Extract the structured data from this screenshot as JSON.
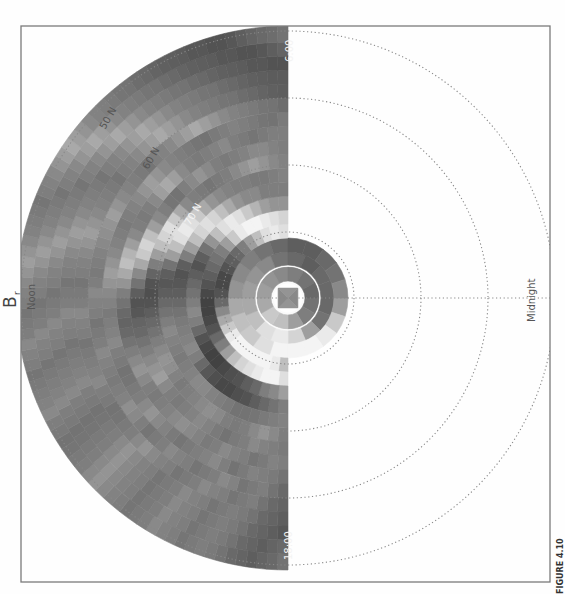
{
  "chart_data": {
    "type": "heatmap",
    "projection": "polar",
    "orientation": "rotated 90deg (noon at left, midnight at right)",
    "title": "B",
    "title_subscript": "r",
    "figure_label": "FIGURE 4.10",
    "local_time_labels": {
      "noon": "Noon",
      "midnight": "Midnight",
      "dawn": "6:00",
      "dusk": "18:00"
    },
    "latitude_labels": [
      "70 N",
      "60 N",
      "50 N"
    ],
    "latitude_rings_px": [
      66,
      133,
      200,
      267
    ],
    "colormap": "grayscale (dark = strong negative, white = strong positive)",
    "grid_on": true,
    "center_px": [
      288,
      298
    ],
    "rings": [
      {
        "r0": 0,
        "r1": 14,
        "sectors": 4,
        "values": [
          0.45,
          0.5,
          0.45,
          0.5
        ]
      },
      {
        "r0": 17,
        "r1": 31,
        "sectors": 12,
        "values": [
          0.35,
          0.4,
          0.55,
          0.7,
          0.75,
          0.6,
          0.55,
          0.5,
          0.45,
          0.4,
          0.35,
          0.3
        ]
      },
      {
        "r0": 33,
        "r1": 46,
        "sectors": 16,
        "values": [
          0.3,
          0.35,
          0.55,
          0.8,
          0.9,
          0.85,
          0.7,
          0.6,
          0.55,
          0.5,
          0.45,
          0.35,
          0.3,
          0.25,
          0.3,
          0.3
        ]
      },
      {
        "r0": 46,
        "r1": 60,
        "sectors": 20,
        "values": [
          0.55,
          0.75,
          0.9,
          0.95,
          0.95,
          0.95,
          0.85,
          0.75,
          0.7,
          0.6,
          0.5,
          0.45,
          0.4,
          0.35,
          0.3,
          0.25,
          0.25,
          0.3,
          0.35,
          0.45
        ]
      },
      {
        "r0": 60,
        "r1": 74,
        "sectors": 24,
        "values": [
          0.7,
          0.9,
          0.95,
          0.95,
          0.95,
          0.95,
          0.95,
          0.9,
          0.75,
          0.6,
          0.45,
          0.3,
          0.2,
          0.15,
          0.15,
          0.2,
          0.25,
          0.3,
          0.4,
          0.55,
          0.7,
          0.85,
          0.9,
          0.85
        ]
      },
      {
        "r0": 74,
        "r1": 88,
        "sectors": 28,
        "values": [
          0.85,
          0.95,
          0.95,
          0.9,
          0.85,
          0.8,
          0.7,
          0.55,
          0.4,
          0.3,
          0.2,
          0.15,
          0.12,
          0.12,
          0.15,
          0.2,
          0.25,
          0.3,
          0.35,
          0.4,
          0.55,
          0.75,
          0.9,
          0.95,
          0.95,
          0.9,
          0.85,
          0.8
        ]
      },
      {
        "r0": 88,
        "r1": 102,
        "sectors": 32,
        "values": [
          0.55,
          0.45,
          0.4,
          0.3,
          0.25,
          0.2,
          0.18,
          0.15,
          0.12,
          0.12,
          0.15,
          0.2,
          0.3,
          0.4,
          0.45,
          0.4,
          0.35,
          0.3,
          0.25,
          0.2,
          0.25,
          0.35,
          0.5,
          0.7,
          0.85,
          0.9,
          0.85,
          0.75,
          0.65,
          0.55,
          0.5,
          0.5
        ]
      },
      {
        "r0": 102,
        "r1": 116,
        "sectors": 36,
        "values": [
          0.4,
          0.35,
          0.3,
          0.25,
          0.2,
          0.18,
          0.15,
          0.15,
          0.18,
          0.22,
          0.3,
          0.4,
          0.45,
          0.42,
          0.4,
          0.38,
          0.35,
          0.3,
          0.25,
          0.22,
          0.2,
          0.25,
          0.4,
          0.55,
          0.7,
          0.8,
          0.85,
          0.8,
          0.7,
          0.6,
          0.5,
          0.45,
          0.45,
          0.4,
          0.4,
          0.4
        ]
      },
      {
        "r0": 116,
        "r1": 130,
        "sectors": 40,
        "values": [
          0.42,
          0.4,
          0.38,
          0.36,
          0.35,
          0.35,
          0.38,
          0.4,
          0.42,
          0.45,
          0.45,
          0.42,
          0.4,
          0.38,
          0.4,
          0.42,
          0.45,
          0.4,
          0.35,
          0.3,
          0.25,
          0.22,
          0.25,
          0.35,
          0.55,
          0.7,
          0.85,
          0.9,
          0.85,
          0.75,
          0.6,
          0.5,
          0.45,
          0.42,
          0.4,
          0.4,
          0.38,
          0.38,
          0.4,
          0.42
        ]
      },
      {
        "r0": 130,
        "r1": 144,
        "sectors": 44,
        "values": [
          0.4,
          0.45,
          0.5,
          0.45,
          0.4,
          0.38,
          0.4,
          0.45,
          0.48,
          0.45,
          0.42,
          0.4,
          0.38,
          0.42,
          0.48,
          0.5,
          0.45,
          0.4,
          0.35,
          0.3,
          0.25,
          0.2,
          0.18,
          0.2,
          0.28,
          0.4,
          0.55,
          0.7,
          0.8,
          0.85,
          0.75,
          0.6,
          0.45,
          0.4,
          0.38,
          0.36,
          0.38,
          0.4,
          0.45,
          0.5,
          0.55,
          0.5,
          0.45,
          0.42
        ]
      },
      {
        "r0": 144,
        "r1": 158,
        "sectors": 48,
        "values": [
          0.38,
          0.4,
          0.42,
          0.45,
          0.4,
          0.38,
          0.35,
          0.38,
          0.42,
          0.45,
          0.42,
          0.4,
          0.38,
          0.4,
          0.45,
          0.55,
          0.5,
          0.45,
          0.4,
          0.35,
          0.3,
          0.28,
          0.22,
          0.2,
          0.25,
          0.35,
          0.45,
          0.6,
          0.75,
          0.8,
          0.7,
          0.55,
          0.45,
          0.4,
          0.36,
          0.35,
          0.4,
          0.45,
          0.5,
          0.45,
          0.4,
          0.38,
          0.4,
          0.42,
          0.45,
          0.45,
          0.42,
          0.4
        ]
      },
      {
        "r0": 158,
        "r1": 172,
        "sectors": 52,
        "values": [
          0.4,
          0.42,
          0.38,
          0.36,
          0.4,
          0.42,
          0.45,
          0.4,
          0.38,
          0.42,
          0.45,
          0.48,
          0.45,
          0.42,
          0.4,
          0.38,
          0.4,
          0.45,
          0.5,
          0.45,
          0.4,
          0.35,
          0.3,
          0.28,
          0.3,
          0.35,
          0.4,
          0.5,
          0.6,
          0.7,
          0.65,
          0.55,
          0.45,
          0.4,
          0.38,
          0.4,
          0.45,
          0.55,
          0.6,
          0.55,
          0.45,
          0.4,
          0.38,
          0.4,
          0.42,
          0.45,
          0.4,
          0.38,
          0.36,
          0.38,
          0.4,
          0.4
        ]
      },
      {
        "r0": 172,
        "r1": 186,
        "sectors": 56,
        "values": [
          0.35,
          0.38,
          0.4,
          0.42,
          0.38,
          0.35,
          0.4,
          0.45,
          0.42,
          0.4,
          0.38,
          0.36,
          0.38,
          0.42,
          0.45,
          0.5,
          0.45,
          0.4,
          0.38,
          0.36,
          0.35,
          0.38,
          0.4,
          0.45,
          0.42,
          0.4,
          0.38,
          0.42,
          0.45,
          0.5,
          0.55,
          0.5,
          0.45,
          0.42,
          0.4,
          0.38,
          0.4,
          0.42,
          0.45,
          0.5,
          0.55,
          0.5,
          0.45,
          0.42,
          0.4,
          0.38,
          0.36,
          0.35,
          0.38,
          0.4,
          0.42,
          0.4,
          0.38,
          0.36,
          0.35,
          0.38
        ]
      },
      {
        "r0": 186,
        "r1": 200,
        "sectors": 60,
        "values": [
          0.3,
          0.35,
          0.4,
          0.38,
          0.36,
          0.42,
          0.45,
          0.4,
          0.38,
          0.36,
          0.4,
          0.42,
          0.45,
          0.4,
          0.38,
          0.36,
          0.4,
          0.45,
          0.48,
          0.42,
          0.4,
          0.38,
          0.4,
          0.42,
          0.45,
          0.4,
          0.38,
          0.36,
          0.4,
          0.42,
          0.45,
          0.4,
          0.38,
          0.4,
          0.42,
          0.45,
          0.48,
          0.5,
          0.55,
          0.5,
          0.45,
          0.42,
          0.4,
          0.38,
          0.36,
          0.4,
          0.42,
          0.45,
          0.5,
          0.55,
          0.6,
          0.55,
          0.5,
          0.45,
          0.42,
          0.4,
          0.38,
          0.36,
          0.35,
          0.32
        ]
      },
      {
        "r0": 200,
        "r1": 214,
        "sectors": 64,
        "values": [
          0.28,
          0.3,
          0.35,
          0.4,
          0.38,
          0.36,
          0.4,
          0.42,
          0.45,
          0.4,
          0.38,
          0.36,
          0.4,
          0.42,
          0.45,
          0.5,
          0.45,
          0.4,
          0.38,
          0.36,
          0.35,
          0.38,
          0.4,
          0.45,
          0.42,
          0.4,
          0.38,
          0.36,
          0.4,
          0.42,
          0.45,
          0.4,
          0.38,
          0.36,
          0.4,
          0.42,
          0.45,
          0.5,
          0.55,
          0.5,
          0.45,
          0.42,
          0.4,
          0.38,
          0.36,
          0.4,
          0.42,
          0.45,
          0.5,
          0.55,
          0.6,
          0.55,
          0.5,
          0.45,
          0.42,
          0.4,
          0.38,
          0.36,
          0.35,
          0.32,
          0.3,
          0.28,
          0.26,
          0.25
        ]
      },
      {
        "r0": 214,
        "r1": 228,
        "sectors": 68,
        "values": [
          0.25,
          0.28,
          0.3,
          0.35,
          0.38,
          0.4,
          0.38,
          0.36,
          0.4,
          0.42,
          0.45,
          0.4,
          0.38,
          0.36,
          0.4,
          0.42,
          0.45,
          0.5,
          0.45,
          0.4,
          0.38,
          0.36,
          0.35,
          0.38,
          0.4,
          0.45,
          0.42,
          0.4,
          0.38,
          0.36,
          0.4,
          0.42,
          0.45,
          0.4,
          0.38,
          0.36,
          0.4,
          0.42,
          0.45,
          0.5,
          0.55,
          0.5,
          0.45,
          0.42,
          0.4,
          0.38,
          0.36,
          0.4,
          0.42,
          0.45,
          0.5,
          0.55,
          0.6,
          0.55,
          0.5,
          0.45,
          0.42,
          0.4,
          0.38,
          0.36,
          0.35,
          0.32,
          0.3,
          0.28,
          0.26,
          0.25,
          0.24,
          0.24
        ]
      },
      {
        "r0": 228,
        "r1": 242,
        "sectors": 72,
        "values": [
          0.22,
          0.25,
          0.28,
          0.3,
          0.35,
          0.38,
          0.4,
          0.38,
          0.36,
          0.4,
          0.42,
          0.45,
          0.4,
          0.38,
          0.36,
          0.4,
          0.42,
          0.45,
          0.5,
          0.45,
          0.4,
          0.38,
          0.36,
          0.35,
          0.38,
          0.4,
          0.45,
          0.42,
          0.4,
          0.38,
          0.36,
          0.4,
          0.42,
          0.45,
          0.4,
          0.38,
          0.36,
          0.4,
          0.42,
          0.45,
          0.5,
          0.55,
          0.5,
          0.45,
          0.42,
          0.4,
          0.38,
          0.36,
          0.4,
          0.42,
          0.45,
          0.5,
          0.55,
          0.6,
          0.55,
          0.5,
          0.45,
          0.42,
          0.4,
          0.38,
          0.36,
          0.35,
          0.32,
          0.3,
          0.28,
          0.26,
          0.25,
          0.24,
          0.22,
          0.22,
          0.2,
          0.2
        ]
      },
      {
        "r0": 242,
        "r1": 256,
        "sectors": 76,
        "values": [
          0.3,
          0.28,
          0.25,
          0.28,
          0.3,
          0.35,
          0.38,
          0.4,
          0.38,
          0.36,
          0.4,
          0.42,
          0.45,
          0.4,
          0.38,
          0.36,
          0.4,
          0.42,
          0.45,
          0.5,
          0.45,
          0.4,
          0.38,
          0.36,
          0.35,
          0.38,
          0.4,
          0.45,
          0.42,
          0.4,
          0.38,
          0.36,
          0.4,
          0.42,
          0.45,
          0.4,
          0.38,
          0.36,
          0.4,
          0.42,
          0.45,
          0.5,
          0.55,
          0.5,
          0.45,
          0.42,
          0.4,
          0.38,
          0.36,
          0.4,
          0.42,
          0.45,
          0.5,
          0.55,
          0.6,
          0.55,
          0.5,
          0.45,
          0.42,
          0.4,
          0.38,
          0.36,
          0.35,
          0.32,
          0.3,
          0.28,
          0.26,
          0.25,
          0.24,
          0.22,
          0.22,
          0.2,
          0.2,
          0.22,
          0.25,
          0.28
        ]
      },
      {
        "r0": 256,
        "r1": 272,
        "sectors": 80,
        "values": [
          0.35,
          0.3,
          0.28,
          0.25,
          0.28,
          0.3,
          0.35,
          0.38,
          0.4,
          0.38,
          0.36,
          0.4,
          0.42,
          0.45,
          0.4,
          0.38,
          0.36,
          0.4,
          0.42,
          0.45,
          0.5,
          0.45,
          0.4,
          0.38,
          0.36,
          0.35,
          0.38,
          0.4,
          0.45,
          0.42,
          0.4,
          0.38,
          0.36,
          0.4,
          0.42,
          0.45,
          0.4,
          0.38,
          0.36,
          0.4,
          0.42,
          0.45,
          0.5,
          0.55,
          0.5,
          0.45,
          0.42,
          0.4,
          0.38,
          0.36,
          0.4,
          0.42,
          0.45,
          0.5,
          0.55,
          0.6,
          0.55,
          0.5,
          0.45,
          0.42,
          0.4,
          0.38,
          0.36,
          0.35,
          0.32,
          0.3,
          0.28,
          0.26,
          0.25,
          0.24,
          0.22,
          0.22,
          0.2,
          0.2,
          0.22,
          0.25,
          0.28,
          0.3,
          0.32,
          0.35
        ]
      }
    ],
    "data_extent_mlt": "approx. 06:00 through noon to 18:00 (dayside hemisphere), inner ring fully filled"
  }
}
